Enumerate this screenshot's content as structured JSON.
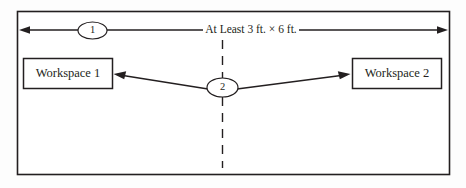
{
  "diagram": {
    "background_color": "#fdfdfd",
    "line_color": "#231f20",
    "fill_color": "#ffffff",
    "dimension": {
      "label": "At Least 3 ft. × 6 ft.",
      "callout_number": "1"
    },
    "center": {
      "callout_number": "2"
    },
    "boxes": [
      {
        "label": "Workspace 1"
      },
      {
        "label": "Workspace 2"
      }
    ]
  }
}
